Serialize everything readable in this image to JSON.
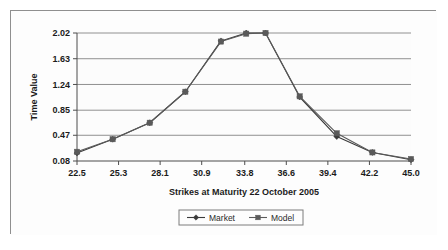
{
  "chart_data": {
    "type": "line",
    "title": "",
    "xlabel": "Strikes at Maturity 22 October 2005",
    "ylabel": "Time Value",
    "xlim": [
      22.5,
      45.0
    ],
    "ylim": [
      0.08,
      2.02
    ],
    "grid": "horizontal",
    "legend_position": "bottom",
    "x_tick_labels": [
      "22.5",
      "25.3",
      "28.1",
      "30.9",
      "33.8",
      "36.6",
      "39.4",
      "42.2",
      "45.0"
    ],
    "y_tick_labels": [
      "0.08",
      "0.47",
      "0.85",
      "1.24",
      "1.63",
      "2.02"
    ],
    "x": [
      22.5,
      24.9,
      27.4,
      29.8,
      32.2,
      33.9,
      35.2,
      37.5,
      40.0,
      42.4,
      45.0
    ],
    "series": [
      {
        "name": "Market",
        "marker": "diamond",
        "color": "#3a3a3a",
        "values": [
          0.2,
          0.41,
          0.66,
          1.13,
          1.9,
          2.02,
          2.02,
          1.05,
          0.45,
          0.21,
          0.1
        ]
      },
      {
        "name": "Model",
        "marker": "square",
        "color": "#5a5a5a",
        "values": [
          0.22,
          0.41,
          0.66,
          1.13,
          1.89,
          2.01,
          2.02,
          1.06,
          0.5,
          0.21,
          0.11
        ]
      }
    ]
  },
  "legend": {
    "entries": [
      {
        "label": "Market"
      },
      {
        "label": "Model"
      }
    ]
  },
  "axes": {
    "y_axis_title": "Time Value",
    "x_axis_title": "Strikes at Maturity 22 October 2005"
  },
  "colors": {
    "frame": "#8f8f8f",
    "gridline": "#909090",
    "axis": "#4d4d4d",
    "text": "#1b1b1b",
    "plot_background": "#fcfcfc",
    "figure_background": "#fdfdfd"
  }
}
